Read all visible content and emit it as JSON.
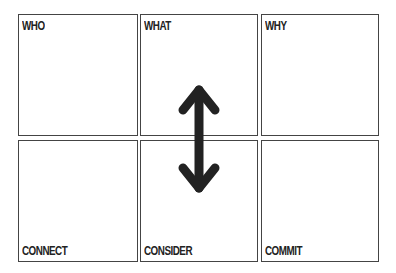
{
  "grid": {
    "cells": [
      {
        "label": "WHO",
        "position": "top"
      },
      {
        "label": "WHAT",
        "position": "top"
      },
      {
        "label": "WHY",
        "position": "top"
      },
      {
        "label": "CONNECT",
        "position": "bottom"
      },
      {
        "label": "CONSIDER",
        "position": "bottom"
      },
      {
        "label": "COMMIT",
        "position": "bottom"
      }
    ]
  },
  "arrow": {
    "icon": "double-headed-vertical-arrow-icon",
    "color": "#222222"
  },
  "colors": {
    "border": "#444444",
    "text": "#222222",
    "background": "#ffffff"
  }
}
